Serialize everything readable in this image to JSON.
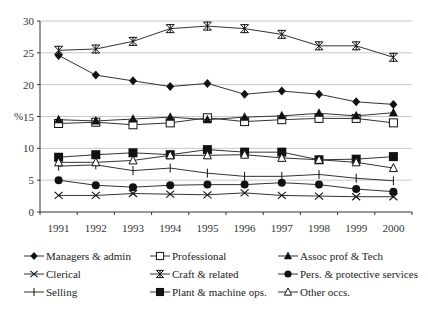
{
  "chart_data": {
    "type": "line",
    "title": "",
    "xlabel": "",
    "ylabel": "%",
    "ylim": [
      0,
      30
    ],
    "yticks": [
      0,
      5,
      10,
      15,
      20,
      25,
      30
    ],
    "grid": true,
    "legend_position": "bottom",
    "x": [
      "1991",
      "1992",
      "1993",
      "1994",
      "1995",
      "1996",
      "1997",
      "1998",
      "1999",
      "2000"
    ],
    "series": [
      {
        "name": "Managers & admin",
        "marker": "diamond-filled",
        "values": [
          24.6,
          21.5,
          20.6,
          19.7,
          20.2,
          18.5,
          19.0,
          18.5,
          17.3,
          16.9
        ]
      },
      {
        "name": "Professional",
        "marker": "square-open",
        "values": [
          13.9,
          14.1,
          13.7,
          14.0,
          14.8,
          14.2,
          14.5,
          14.7,
          14.7,
          14.0
        ]
      },
      {
        "name": "Assoc prof & Tech",
        "marker": "triangle-filled",
        "values": [
          14.5,
          14.3,
          14.6,
          14.9,
          14.5,
          14.9,
          15.1,
          15.5,
          15.1,
          15.6
        ]
      },
      {
        "name": "Clerical",
        "marker": "x",
        "values": [
          2.6,
          2.6,
          2.9,
          2.8,
          2.7,
          3.0,
          2.6,
          2.5,
          2.4,
          2.4
        ]
      },
      {
        "name": "Craft & related",
        "marker": "asterisk",
        "values": [
          25.4,
          25.6,
          26.8,
          28.8,
          29.2,
          28.8,
          27.9,
          26.1,
          26.1,
          24.3
        ]
      },
      {
        "name": "Pers. & protective services",
        "marker": "circle-filled",
        "values": [
          5.0,
          4.2,
          3.9,
          4.2,
          4.3,
          4.3,
          4.6,
          4.3,
          3.6,
          3.2
        ]
      },
      {
        "name": "Selling",
        "marker": "plus",
        "values": [
          7.2,
          7.4,
          6.5,
          6.9,
          6.1,
          5.6,
          5.6,
          5.9,
          5.3,
          4.9
        ]
      },
      {
        "name": "Plant & machine ops.",
        "marker": "square-filled",
        "values": [
          8.6,
          9.0,
          9.3,
          9.0,
          9.8,
          9.4,
          9.4,
          8.2,
          8.3,
          8.7
        ]
      },
      {
        "name": "Other occs.",
        "marker": "triangle-open",
        "values": [
          7.8,
          7.8,
          8.1,
          8.9,
          8.9,
          9.0,
          8.5,
          8.2,
          7.8,
          6.9
        ]
      }
    ]
  },
  "axis": {
    "y_label": "%",
    "line_color": "#333333",
    "grid_color": "#c8c8c8"
  },
  "legend": {
    "items": [
      {
        "label": "Managers & admin",
        "marker": "diamond-filled"
      },
      {
        "label": "Professional",
        "marker": "square-open"
      },
      {
        "label": "Assoc prof & Tech",
        "marker": "triangle-filled"
      },
      {
        "label": "Clerical",
        "marker": "x"
      },
      {
        "label": "Craft & related",
        "marker": "asterisk"
      },
      {
        "label": "Pers. & protective services",
        "marker": "circle-filled"
      },
      {
        "label": "Selling",
        "marker": "plus"
      },
      {
        "label": "Plant & machine ops.",
        "marker": "square-filled"
      },
      {
        "label": "Other occs.",
        "marker": "triangle-open"
      }
    ]
  }
}
